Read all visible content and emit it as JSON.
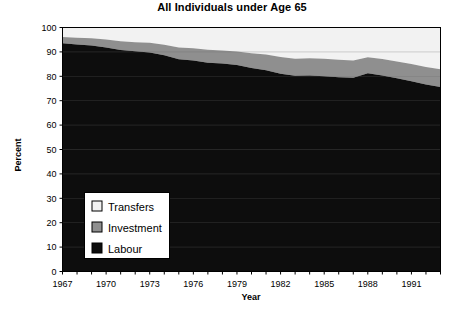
{
  "chart_data": {
    "type": "area",
    "title": "All Individuals under Age 65",
    "xlabel": "Year",
    "ylabel": "Percent",
    "stacked": true,
    "grid": true,
    "legend_position": "inside-lower-left",
    "xlim": [
      1967,
      1993
    ],
    "ylim": [
      0,
      100
    ],
    "ytick_step": 10,
    "yticks": [
      0,
      10,
      20,
      30,
      40,
      50,
      60,
      70,
      80,
      90,
      100
    ],
    "xticks_labeled": [
      1967,
      1970,
      1973,
      1976,
      1979,
      1982,
      1985,
      1988,
      1991
    ],
    "xtick_step_minor": 1,
    "x": [
      1967,
      1968,
      1969,
      1970,
      1971,
      1972,
      1973,
      1974,
      1975,
      1976,
      1977,
      1978,
      1979,
      1980,
      1981,
      1982,
      1983,
      1984,
      1985,
      1986,
      1987,
      1988,
      1989,
      1990,
      1991,
      1992,
      1993
    ],
    "series": [
      {
        "name": "Labour",
        "color": "#0d0d0d",
        "values": [
          93.5,
          93.0,
          92.6,
          91.8,
          90.8,
          90.3,
          89.8,
          88.6,
          87.0,
          86.5,
          85.6,
          85.2,
          84.6,
          83.4,
          82.5,
          81.0,
          80.2,
          80.3,
          80.0,
          79.6,
          79.4,
          81.2,
          80.3,
          79.2,
          78.0,
          76.6,
          75.6
        ]
      },
      {
        "name": "Investment",
        "color": "#8f8f8f",
        "values": [
          2.6,
          2.8,
          3.0,
          3.3,
          3.6,
          3.7,
          3.9,
          4.3,
          4.8,
          5.0,
          5.3,
          5.4,
          5.6,
          6.0,
          6.4,
          6.9,
          7.0,
          7.1,
          7.2,
          7.2,
          7.1,
          6.6,
          6.8,
          6.9,
          7.0,
          7.2,
          7.3
        ]
      },
      {
        "name": "Transfers",
        "color": "#f2f2f2",
        "values": [
          3.9,
          4.2,
          4.4,
          4.9,
          5.6,
          6.0,
          6.3,
          7.1,
          8.2,
          8.5,
          9.1,
          9.4,
          9.8,
          10.6,
          11.1,
          12.1,
          12.8,
          12.6,
          12.8,
          13.2,
          13.5,
          12.2,
          12.9,
          13.9,
          15.0,
          16.2,
          17.1
        ]
      }
    ],
    "stack_tops": {
      "labour": [
        93.5,
        93.0,
        92.6,
        91.8,
        90.8,
        90.3,
        89.8,
        88.6,
        87.0,
        86.5,
        85.6,
        85.2,
        84.6,
        83.4,
        82.5,
        81.0,
        80.2,
        80.3,
        80.0,
        79.6,
        79.4,
        81.2,
        80.3,
        79.2,
        78.0,
        76.6,
        75.6
      ],
      "investment": [
        96.1,
        95.8,
        95.6,
        95.1,
        94.4,
        94.0,
        93.7,
        92.9,
        91.8,
        91.5,
        90.9,
        90.6,
        90.2,
        89.4,
        88.9,
        87.9,
        87.2,
        87.4,
        87.2,
        86.8,
        86.5,
        87.8,
        87.1,
        86.1,
        85.0,
        83.8,
        82.9
      ],
      "transfers": [
        100,
        100,
        100,
        100,
        100,
        100,
        100,
        100,
        100,
        100,
        100,
        100,
        100,
        100,
        100,
        100,
        100,
        100,
        100,
        100,
        100,
        100,
        100,
        100,
        100,
        100,
        100
      ]
    },
    "legend_entries": [
      {
        "label": "Transfers",
        "color": "#f2f2f2"
      },
      {
        "label": "Investment",
        "color": "#8f8f8f"
      },
      {
        "label": "Labour",
        "color": "#0d0d0d"
      }
    ]
  }
}
